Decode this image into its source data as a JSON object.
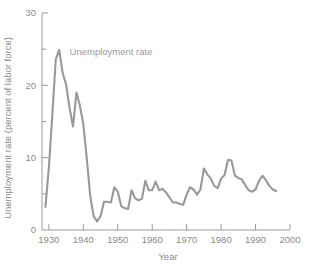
{
  "chart_data": {
    "type": "line",
    "title": "",
    "subtitle": "",
    "xlabel": "Year",
    "ylabel": "Unemployment rate (percent of labor force)",
    "xlim": [
      1928,
      2000
    ],
    "ylim": [
      0,
      30
    ],
    "grid": false,
    "legend_position": "inline-annotation",
    "line_color": "#999999",
    "axis_color": "#9a9a9a",
    "text_color": "#8a8a8a",
    "x_ticks_major": [
      1930,
      1940,
      1950,
      1960,
      1970,
      1980,
      1990,
      2000
    ],
    "x_tick_labels": [
      "1930",
      "1940",
      "1950",
      "1960",
      "1970",
      "1980",
      "1990",
      "2000"
    ],
    "y_ticks_major": [
      0,
      10,
      20,
      30
    ],
    "y_tick_labels": [
      "0",
      "10",
      "20",
      "30"
    ],
    "y_ticks_minor": [
      5,
      15,
      25
    ],
    "annotations": [
      {
        "text": "Unemployment rate",
        "x": 1936,
        "y": 24.2
      }
    ],
    "series": [
      {
        "name": "Unemployment rate",
        "color": "#999999",
        "x": [
          1929,
          1930,
          1931,
          1932,
          1933,
          1934,
          1935,
          1936,
          1937,
          1938,
          1939,
          1940,
          1941,
          1942,
          1943,
          1944,
          1945,
          1946,
          1947,
          1948,
          1949,
          1950,
          1951,
          1952,
          1953,
          1954,
          1955,
          1956,
          1957,
          1958,
          1959,
          1960,
          1961,
          1962,
          1963,
          1964,
          1965,
          1966,
          1967,
          1968,
          1969,
          1970,
          1971,
          1972,
          1973,
          1974,
          1975,
          1976,
          1977,
          1978,
          1979,
          1980,
          1981,
          1982,
          1983,
          1984,
          1985,
          1986,
          1987,
          1988,
          1989,
          1990,
          1991,
          1992,
          1993,
          1994,
          1995,
          1996
        ],
        "values": [
          3.2,
          8.7,
          15.9,
          23.6,
          24.9,
          21.7,
          20.1,
          16.9,
          14.3,
          19.0,
          17.2,
          14.6,
          9.9,
          4.7,
          1.9,
          1.2,
          1.9,
          3.9,
          3.9,
          3.8,
          5.9,
          5.3,
          3.3,
          3.0,
          2.9,
          5.5,
          4.4,
          4.1,
          4.3,
          6.8,
          5.5,
          5.5,
          6.7,
          5.5,
          5.7,
          5.2,
          4.5,
          3.8,
          3.8,
          3.6,
          3.5,
          4.9,
          5.9,
          5.6,
          4.9,
          5.6,
          8.5,
          7.7,
          7.1,
          6.1,
          5.8,
          7.1,
          7.6,
          9.7,
          9.6,
          7.5,
          7.2,
          7.0,
          6.2,
          5.5,
          5.3,
          5.6,
          6.8,
          7.5,
          6.9,
          6.1,
          5.6,
          5.4
        ]
      }
    ]
  },
  "figure": {
    "xlabel": "Year",
    "ylabel": "Unemployment rate (percent of labor force)",
    "annotation": "Unemployment rate"
  }
}
